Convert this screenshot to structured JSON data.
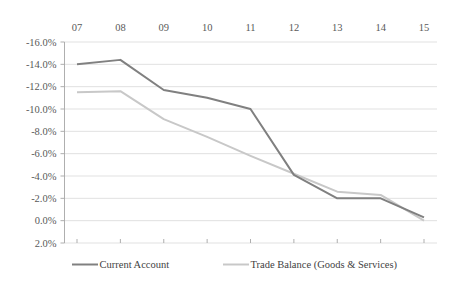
{
  "chart_data": {
    "type": "line",
    "title": "",
    "subtitle": "",
    "xlabel": "",
    "ylabel": "",
    "grid": true,
    "legend_position": "bottom",
    "x_axis_position": "top",
    "y_inverted": true,
    "categories": [
      "07",
      "08",
      "09",
      "10",
      "11",
      "12",
      "13",
      "14",
      "15"
    ],
    "ylim": [
      -16.0,
      2.0
    ],
    "ytick_labels": [
      "-16.0%",
      "-14.0%",
      "-12.0%",
      "-10.0%",
      "-8.0%",
      "-6.0%",
      "-4.0%",
      "-2.0%",
      "0.0%",
      "2.0%"
    ],
    "ytick_values": [
      -16.0,
      -14.0,
      -12.0,
      -10.0,
      -8.0,
      -6.0,
      -4.0,
      -2.0,
      0.0,
      2.0
    ],
    "series": [
      {
        "name": "Current Account",
        "color": "#808080",
        "width": 2.0,
        "values": [
          -14.0,
          -14.4,
          -11.7,
          -11.0,
          -10.0,
          -4.1,
          -2.0,
          -2.0,
          -0.3
        ]
      },
      {
        "name": "Trade Balance (Goods & Services)",
        "color": "#c8c8c8",
        "width": 2.0,
        "values": [
          -11.5,
          -11.6,
          -9.1,
          -7.5,
          -5.8,
          -4.2,
          -2.6,
          -2.3,
          0.0
        ]
      }
    ]
  },
  "legend": {
    "items": [
      {
        "label": "Current Account",
        "color": "#808080"
      },
      {
        "label": "Trade Balance (Goods & Services)",
        "color": "#c8c8c8"
      }
    ]
  }
}
